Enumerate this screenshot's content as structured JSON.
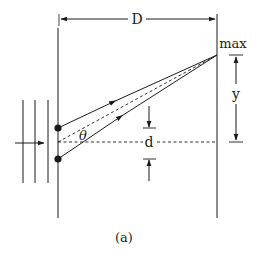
{
  "figure": {
    "caption": "(a)"
  },
  "labels": {
    "distance": "D",
    "maximum": "max",
    "displacement": "y",
    "slit_separation": "d",
    "angle": "θ"
  },
  "elements": {
    "slits": [
      {
        "name": "top-slit",
        "x": 58,
        "y": 128
      },
      {
        "name": "bottom-slit",
        "x": 58,
        "y": 159
      }
    ],
    "wavefronts_count": 3,
    "screen": "right vertical line",
    "barrier": "left vertical line"
  },
  "colors": {
    "ink": "#1a1a1a",
    "background": "#ffffff"
  }
}
